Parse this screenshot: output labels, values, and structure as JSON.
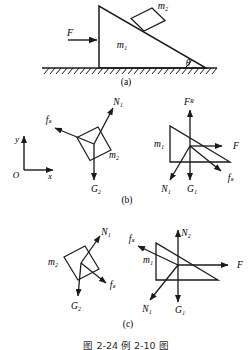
{
  "figure": {
    "caption": "图 2-24    例 2-10 图",
    "panels": [
      {
        "id": "a",
        "label": "(a)",
        "description": "Inclined wedge m1 on hatched ground with block m2 on the incline, horizontal force F applied to the left vertical face, incline angle theta at the right.",
        "labels": {
          "wedge": "m₁",
          "block": "m₂",
          "applied_force": "F",
          "angle": "θ"
        }
      },
      {
        "id": "b",
        "label": "(b)",
        "description": "Free-body diagrams: tilted block m2 with N1, f_s, G2; wedge m1 with F_R, F, f_s, N1, G1.",
        "left_body": {
          "body": "m₂",
          "forces": [
            "N₁",
            "fₛ",
            "G₂"
          ]
        },
        "right_body": {
          "body": "m₁",
          "forces": [
            "Fᴿ",
            "F",
            "fₛ",
            "N₁",
            "G₁"
          ]
        },
        "axes": {
          "origin": "O",
          "x": "x",
          "y": "y"
        }
      },
      {
        "id": "c",
        "label": "(c)",
        "description": "Free-body diagrams: tilted block m2 with N1, f_s, G2; wedge m1 with N2, f_s, F, N1, G1.",
        "left_body": {
          "body": "m₂",
          "forces": [
            "N₁",
            "fₛ",
            "G₂"
          ]
        },
        "right_body": {
          "body": "m₁",
          "forces": [
            "N₂",
            "fₛ",
            "F",
            "N₁",
            "G₁"
          ]
        }
      }
    ]
  },
  "style": {
    "line_color": "#1a1a1a",
    "background": "#ffffff"
  }
}
